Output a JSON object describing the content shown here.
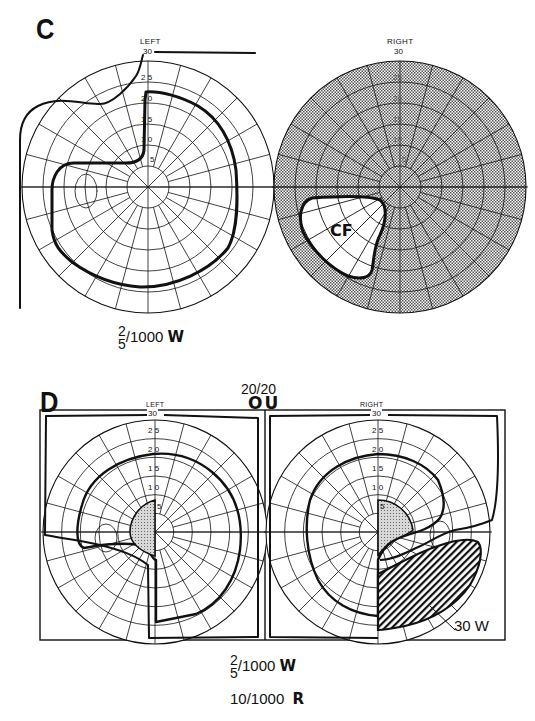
{
  "panels": [
    {
      "id": "C",
      "letter": "C",
      "eyes": [
        {
          "label": "LEFT",
          "top_value": "30",
          "ring_labels": [
            "5",
            "1 0",
            "1 5",
            "2 0",
            "2 5"
          ],
          "annotation": ""
        },
        {
          "label": "RIGHT",
          "top_value": "30",
          "ring_labels": [
            "5",
            "10",
            "15",
            "20",
            "25"
          ],
          "annotation": "CF"
        }
      ],
      "legend": {
        "numerator": "2",
        "denominator": "5",
        "rest": "/1000",
        "code": "W"
      }
    },
    {
      "id": "D",
      "letter": "D",
      "acuity": "20/20",
      "both_eyes": "OU",
      "eyes": [
        {
          "label": "LEFT",
          "top_value": "30",
          "ring_labels": [
            "5",
            "1 0",
            "1 5",
            "2 0",
            "2 5"
          ],
          "annotation": ""
        },
        {
          "label": "RIGHT",
          "top_value": "30",
          "ring_labels": [
            "5",
            "1 0",
            "1 5",
            "2 0",
            "2 5"
          ],
          "annotation": "30 W"
        }
      ],
      "legend": {
        "numerator": "2",
        "denominator": "5",
        "rest": "/1000",
        "code": "W",
        "line2_value": "10/1000",
        "line2_code": "R"
      }
    }
  ],
  "colors": {
    "ink": "#111111",
    "stipple": "#9a9a9a",
    "paper": "#ffffff"
  }
}
